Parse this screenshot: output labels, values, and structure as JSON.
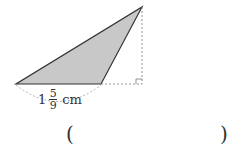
{
  "figure": {
    "shape": "obtuse triangle with height drawn outside",
    "fill_color": "#c8c8c8",
    "stroke_color": "#333333",
    "base_label": {
      "whole": "1",
      "numerator": "5",
      "denominator": "9",
      "unit": "cm"
    }
  },
  "answer": {
    "open_paren": "(",
    "close_paren": ")",
    "value": ""
  }
}
